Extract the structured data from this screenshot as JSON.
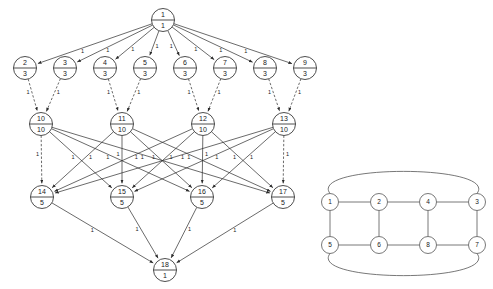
{
  "diagram": {
    "title": "",
    "left_graph": {
      "name": "layered-flow-network",
      "type": "directed-acyclic-graph",
      "edge_label_default": "1",
      "levels": [
        {
          "level": 0,
          "y": 20,
          "nodes": [
            {
              "id": "1",
              "top": "1",
              "bottom": "1",
              "x": 163,
              "y": 20
            }
          ]
        },
        {
          "level": 1,
          "y": 68,
          "nodes": [
            {
              "id": "2",
              "top": "2",
              "bottom": "3",
              "x": 25,
              "y": 68
            },
            {
              "id": "3",
              "top": "3",
              "bottom": "3",
              "x": 65,
              "y": 68
            },
            {
              "id": "4",
              "top": "4",
              "bottom": "3",
              "x": 105,
              "y": 68
            },
            {
              "id": "5",
              "top": "5",
              "bottom": "3",
              "x": 145,
              "y": 68
            },
            {
              "id": "6",
              "top": "6",
              "bottom": "3",
              "x": 185,
              "y": 68
            },
            {
              "id": "7",
              "top": "7",
              "bottom": "3",
              "x": 225,
              "y": 68
            },
            {
              "id": "8",
              "top": "8",
              "bottom": "3",
              "x": 265,
              "y": 68
            },
            {
              "id": "9",
              "top": "9",
              "bottom": "3",
              "x": 305,
              "y": 68
            }
          ]
        },
        {
          "level": 2,
          "y": 124,
          "nodes": [
            {
              "id": "10",
              "top": "10",
              "bottom": "10",
              "x": 41,
              "y": 124
            },
            {
              "id": "11",
              "top": "11",
              "bottom": "10",
              "x": 122,
              "y": 124
            },
            {
              "id": "12",
              "top": "12",
              "bottom": "10",
              "x": 203,
              "y": 124
            },
            {
              "id": "13",
              "top": "13",
              "bottom": "10",
              "x": 284,
              "y": 124
            }
          ]
        },
        {
          "level": 3,
          "y": 197,
          "nodes": [
            {
              "id": "14",
              "top": "14",
              "bottom": "5",
              "x": 42,
              "y": 197
            },
            {
              "id": "15",
              "top": "15",
              "bottom": "5",
              "x": 122,
              "y": 197
            },
            {
              "id": "16",
              "top": "16",
              "bottom": "5",
              "x": 202,
              "y": 197
            },
            {
              "id": "17",
              "top": "17",
              "bottom": "5",
              "x": 283,
              "y": 197
            }
          ]
        },
        {
          "level": 4,
          "y": 270,
          "nodes": [
            {
              "id": "18",
              "top": "18",
              "bottom": "1",
              "x": 165,
              "y": 270
            }
          ]
        }
      ],
      "edges": [
        {
          "from": "1",
          "to": "2",
          "label": "1",
          "style": "solid"
        },
        {
          "from": "1",
          "to": "3",
          "label": "1",
          "style": "solid"
        },
        {
          "from": "1",
          "to": "4",
          "label": "1",
          "style": "solid"
        },
        {
          "from": "1",
          "to": "5",
          "label": "1",
          "style": "solid"
        },
        {
          "from": "1",
          "to": "6",
          "label": "1",
          "style": "solid"
        },
        {
          "from": "1",
          "to": "7",
          "label": "1",
          "style": "solid"
        },
        {
          "from": "1",
          "to": "8",
          "label": "1",
          "style": "solid"
        },
        {
          "from": "1",
          "to": "9",
          "label": "1",
          "style": "solid"
        },
        {
          "from": "2",
          "to": "10",
          "label": "1",
          "style": "dashed"
        },
        {
          "from": "3",
          "to": "10",
          "label": "1",
          "style": "dashed"
        },
        {
          "from": "4",
          "to": "11",
          "label": "1",
          "style": "dashed"
        },
        {
          "from": "5",
          "to": "11",
          "label": "1",
          "style": "dashed"
        },
        {
          "from": "6",
          "to": "12",
          "label": "1",
          "style": "dashed"
        },
        {
          "from": "7",
          "to": "12",
          "label": "1",
          "style": "dashed"
        },
        {
          "from": "8",
          "to": "13",
          "label": "1",
          "style": "dashed"
        },
        {
          "from": "9",
          "to": "13",
          "label": "1",
          "style": "dashed"
        },
        {
          "from": "10",
          "to": "14",
          "label": "1",
          "style": "dashed"
        },
        {
          "from": "10",
          "to": "15",
          "label": "1",
          "style": "solid"
        },
        {
          "from": "10",
          "to": "16",
          "label": "1",
          "style": "solid"
        },
        {
          "from": "10",
          "to": "17",
          "label": "1",
          "style": "solid"
        },
        {
          "from": "11",
          "to": "14",
          "label": "1",
          "style": "solid"
        },
        {
          "from": "11",
          "to": "15",
          "label": "1",
          "style": "solid"
        },
        {
          "from": "11",
          "to": "16",
          "label": "1",
          "style": "solid"
        },
        {
          "from": "11",
          "to": "17",
          "label": "1",
          "style": "solid"
        },
        {
          "from": "12",
          "to": "14",
          "label": "1",
          "style": "solid"
        },
        {
          "from": "12",
          "to": "15",
          "label": "1",
          "style": "solid"
        },
        {
          "from": "12",
          "to": "16",
          "label": "1",
          "style": "solid"
        },
        {
          "from": "12",
          "to": "17",
          "label": "1",
          "style": "solid"
        },
        {
          "from": "13",
          "to": "14",
          "label": "1",
          "style": "solid"
        },
        {
          "from": "13",
          "to": "15",
          "label": "1",
          "style": "solid"
        },
        {
          "from": "13",
          "to": "16",
          "label": "1",
          "style": "solid"
        },
        {
          "from": "13",
          "to": "17",
          "label": "1",
          "style": "dashed"
        },
        {
          "from": "14",
          "to": "18",
          "label": "1",
          "style": "solid"
        },
        {
          "from": "15",
          "to": "18",
          "label": "1",
          "style": "solid"
        },
        {
          "from": "16",
          "to": "18",
          "label": "1",
          "style": "solid"
        },
        {
          "from": "17",
          "to": "18",
          "label": "1",
          "style": "solid"
        }
      ]
    },
    "right_graph": {
      "name": "cube-graph",
      "type": "undirected-graph",
      "nodes": [
        {
          "id": "1",
          "label": "1",
          "x": 330,
          "y": 202
        },
        {
          "id": "2",
          "label": "2",
          "x": 379,
          "y": 202
        },
        {
          "id": "4",
          "label": "4",
          "x": 428,
          "y": 202
        },
        {
          "id": "3",
          "label": "3",
          "x": 477,
          "y": 202
        },
        {
          "id": "5",
          "label": "5",
          "x": 330,
          "y": 245
        },
        {
          "id": "6",
          "label": "6",
          "x": 379,
          "y": 245
        },
        {
          "id": "8",
          "label": "8",
          "x": 428,
          "y": 245
        },
        {
          "id": "7",
          "label": "7",
          "x": 477,
          "y": 245
        }
      ],
      "edges": [
        {
          "from": "1",
          "to": "2",
          "style": "straight"
        },
        {
          "from": "2",
          "to": "4",
          "style": "straight"
        },
        {
          "from": "4",
          "to": "3",
          "style": "straight"
        },
        {
          "from": "5",
          "to": "6",
          "style": "straight"
        },
        {
          "from": "6",
          "to": "8",
          "style": "straight"
        },
        {
          "from": "8",
          "to": "7",
          "style": "straight"
        },
        {
          "from": "1",
          "to": "5",
          "style": "straight"
        },
        {
          "from": "2",
          "to": "6",
          "style": "straight"
        },
        {
          "from": "4",
          "to": "8",
          "style": "straight"
        },
        {
          "from": "3",
          "to": "7",
          "style": "straight"
        },
        {
          "from": "1",
          "to": "3",
          "style": "curved-top"
        },
        {
          "from": "5",
          "to": "7",
          "style": "curved-bottom"
        }
      ]
    }
  }
}
